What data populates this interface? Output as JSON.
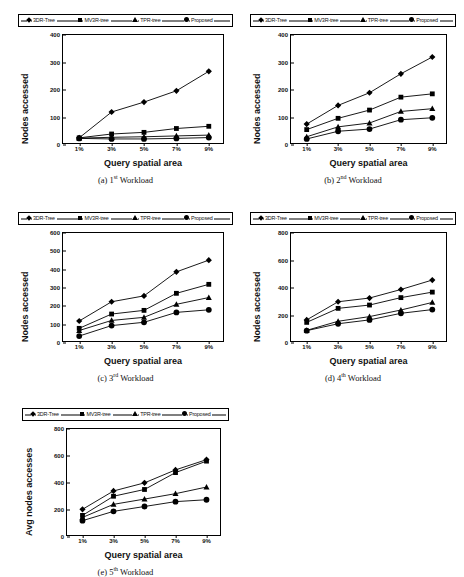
{
  "figure": {
    "legend_labels": [
      "3DR-Tree",
      "MV3R-tree",
      "TPR-tree",
      "Proposed"
    ],
    "legend_markers": [
      "diamond",
      "square",
      "triangle",
      "circle"
    ],
    "xlabel": "Query spatial area",
    "categories": [
      "1%",
      "3%",
      "5%",
      "7%",
      "9%"
    ]
  },
  "captions": {
    "a": {
      "prefix": "(a) 1",
      "sup": "st",
      "suffix": " Workload"
    },
    "b": {
      "prefix": "(b) 2",
      "sup": "nd",
      "suffix": " Workload"
    },
    "c": {
      "prefix": "(c) 3",
      "sup": "rd",
      "suffix": " Workload"
    },
    "d": {
      "prefix": "(d) 4",
      "sup": "th",
      "suffix": " Workload"
    },
    "e": {
      "prefix": "(e) 5",
      "sup": "th",
      "suffix": " Workload"
    }
  },
  "chart_data": [
    {
      "id": "a",
      "type": "line",
      "title": "(a) 1st Workload",
      "xlabel": "Query spatial area",
      "ylabel": "Nodes accessed",
      "categories": [
        "1%",
        "3%",
        "5%",
        "7%",
        "9%"
      ],
      "yticks": [
        0,
        100,
        200,
        300,
        400
      ],
      "ylim": [
        0,
        400
      ],
      "grid": false,
      "legend": "top",
      "series": [
        {
          "name": "3DR-Tree",
          "marker": "diamond",
          "values": [
            26,
            120,
            156,
            197,
            268
          ]
        },
        {
          "name": "MV3R-tree",
          "marker": "square",
          "values": [
            26,
            40,
            46,
            60,
            68
          ]
        },
        {
          "name": "TPR-tree",
          "marker": "triangle",
          "values": [
            25,
            28,
            30,
            33,
            36
          ]
        },
        {
          "name": "Proposed",
          "marker": "circle",
          "values": [
            24,
            22,
            22,
            24,
            27
          ]
        }
      ]
    },
    {
      "id": "b",
      "type": "line",
      "title": "(b) 2nd Workload",
      "xlabel": "Query spatial area",
      "ylabel": "Nodes accessed",
      "categories": [
        "1%",
        "3%",
        "5%",
        "7%",
        "9%"
      ],
      "yticks": [
        0,
        100,
        200,
        300,
        400
      ],
      "ylim": [
        0,
        400
      ],
      "grid": false,
      "legend": "top",
      "series": [
        {
          "name": "3DR-Tree",
          "marker": "diamond",
          "values": [
            76,
            144,
            190,
            259,
            320
          ]
        },
        {
          "name": "MV3R-tree",
          "marker": "square",
          "values": [
            56,
            97,
            127,
            174,
            186
          ]
        },
        {
          "name": "TPR-tree",
          "marker": "triangle",
          "values": [
            30,
            66,
            80,
            122,
            132
          ]
        },
        {
          "name": "Proposed",
          "marker": "circle",
          "values": [
            22,
            50,
            58,
            92,
            99
          ]
        }
      ]
    },
    {
      "id": "c",
      "type": "line",
      "title": "(c) 3rd Workload",
      "xlabel": "Query spatial area",
      "ylabel": "Nodes accessed",
      "categories": [
        "1%",
        "3%",
        "5%",
        "7%",
        "9%"
      ],
      "yticks": [
        0,
        100,
        200,
        300,
        400,
        500,
        600
      ],
      "ylim": [
        0,
        600
      ],
      "grid": false,
      "legend": "top",
      "series": [
        {
          "name": "3DR-Tree",
          "marker": "diamond",
          "values": [
            120,
            225,
            257,
            388,
            452
          ]
        },
        {
          "name": "MV3R-tree",
          "marker": "square",
          "values": [
            80,
            158,
            178,
            271,
            320
          ]
        },
        {
          "name": "TPR-tree",
          "marker": "triangle",
          "values": [
            68,
            123,
            140,
            211,
            248
          ]
        },
        {
          "name": "Proposed",
          "marker": "circle",
          "values": [
            38,
            95,
            113,
            167,
            181
          ]
        }
      ]
    },
    {
      "id": "d",
      "type": "line",
      "title": "(d) 4th Workload",
      "xlabel": "Query spatial area",
      "ylabel": "Nodes accessed",
      "categories": [
        "1%",
        "3%",
        "5%",
        "7%",
        "9%"
      ],
      "yticks": [
        0,
        200,
        400,
        600,
        800
      ],
      "ylim": [
        0,
        800
      ],
      "grid": false,
      "legend": "top",
      "series": [
        {
          "name": "3DR-Tree",
          "marker": "diamond",
          "values": [
            168,
            300,
            327,
            389,
            458
          ]
        },
        {
          "name": "MV3R-tree",
          "marker": "square",
          "values": [
            150,
            252,
            276,
            330,
            370
          ]
        },
        {
          "name": "TPR-tree",
          "marker": "triangle",
          "values": [
            92,
            158,
            192,
            240,
            295
          ]
        },
        {
          "name": "Proposed",
          "marker": "circle",
          "values": [
            90,
            140,
            168,
            216,
            243
          ]
        }
      ]
    },
    {
      "id": "e",
      "type": "line",
      "title": "(e) 5th Workload",
      "xlabel": "Query spatial area",
      "ylabel": "Avg nodes accesses",
      "categories": [
        "1%",
        "3%",
        "5%",
        "7%",
        "9%"
      ],
      "yticks": [
        0,
        200,
        400,
        600,
        800
      ],
      "ylim": [
        0,
        800
      ],
      "grid": false,
      "legend": "top",
      "series": [
        {
          "name": "3DR-Tree",
          "marker": "diamond",
          "values": [
            205,
            341,
            401,
            497,
            573
          ]
        },
        {
          "name": "MV3R-tree",
          "marker": "square",
          "values": [
            160,
            302,
            352,
            477,
            562
          ]
        },
        {
          "name": "TPR-tree",
          "marker": "triangle",
          "values": [
            145,
            242,
            281,
            321,
            370
          ]
        },
        {
          "name": "Proposed",
          "marker": "circle",
          "values": [
            121,
            190,
            226,
            262,
            276
          ]
        }
      ]
    }
  ]
}
